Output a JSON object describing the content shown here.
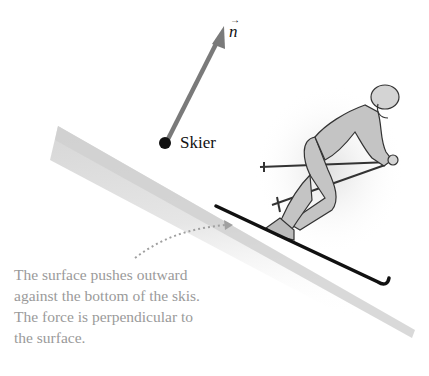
{
  "diagram": {
    "vector": {
      "symbol": "n",
      "accent": "→",
      "color": "#7a7a7a"
    },
    "point_label": "Skier",
    "caption_lines": [
      "The surface pushes outward",
      "against the bottom of the skis.",
      "The force is perpendicular to",
      "the surface."
    ],
    "colors": {
      "slope": "#c8c8c8",
      "skier_fill": "#c4c4c4",
      "outline": "#333333",
      "caption": "#9a9a9a",
      "dotted_arrow": "#a0a0a0"
    }
  }
}
